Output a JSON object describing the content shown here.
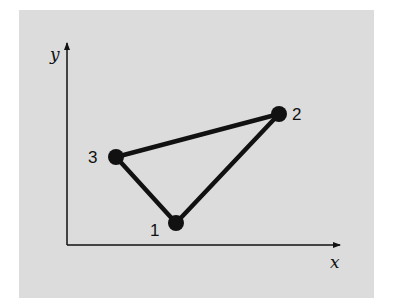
{
  "diagram": {
    "axes": {
      "x_label": "x",
      "y_label": "y"
    },
    "points": [
      {
        "id": "1",
        "label": "1",
        "x": 176,
        "y": 223
      },
      {
        "id": "2",
        "label": "2",
        "x": 279,
        "y": 114
      },
      {
        "id": "3",
        "label": "3",
        "x": 116,
        "y": 157
      }
    ],
    "edges": [
      {
        "from": "1",
        "to": "2"
      },
      {
        "from": "2",
        "to": "3"
      },
      {
        "from": "3",
        "to": "1"
      }
    ],
    "colors": {
      "background": "#dcdcdc",
      "stroke": "#111111"
    }
  }
}
